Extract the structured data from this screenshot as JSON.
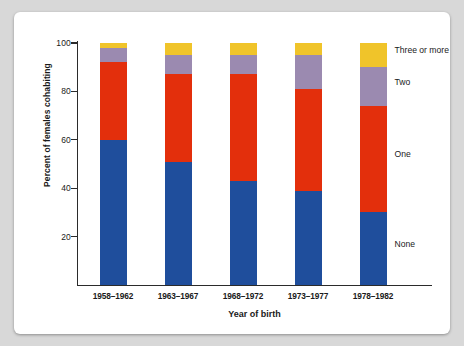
{
  "chart_data": {
    "type": "bar",
    "stacked": true,
    "title": "",
    "xlabel": "Year of birth",
    "ylabel": "Percent of females cohabiting",
    "categories": [
      "1958–1962",
      "1963–1967",
      "1968–1972",
      "1973–1977",
      "1978–1982"
    ],
    "series": [
      {
        "name": "None",
        "color": "#1f4e9c",
        "values": [
          60,
          51,
          43,
          39,
          30
        ]
      },
      {
        "name": "One",
        "color": "#e32f0c",
        "values": [
          32,
          36,
          44,
          42,
          44
        ]
      },
      {
        "name": "Two",
        "color": "#9b8ab0",
        "values": [
          6,
          8,
          8,
          14,
          16
        ]
      },
      {
        "name": "Three or more",
        "color": "#f0c42a",
        "values": [
          2,
          5,
          5,
          5,
          10
        ]
      }
    ],
    "ylim": [
      0,
      100
    ],
    "yticks": [
      20,
      40,
      60,
      80,
      100
    ],
    "ytick_labels": [
      "20",
      "40",
      "60",
      "80",
      "100"
    ],
    "grid": false,
    "legend_position": "right-inline",
    "legend": [
      {
        "label": "Three or more",
        "color": "#f0c42a"
      },
      {
        "label": "Two",
        "color": "#9b8ab0"
      },
      {
        "label": "One",
        "color": "#e32f0c"
      },
      {
        "label": "None",
        "color": "#1f4e9c"
      }
    ]
  },
  "figure": {
    "background": "#ffffff",
    "page_background": "#d8d8d8",
    "axis_color": "#2b2b2b"
  }
}
